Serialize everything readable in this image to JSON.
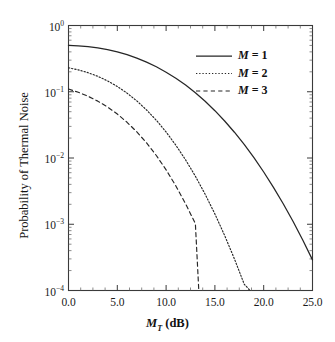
{
  "chart_data": {
    "type": "line",
    "title": "",
    "xlabel": "M_T (dB)",
    "xlabel_parts": {
      "var": "M",
      "sub": "T",
      "unit": "(dB)"
    },
    "ylabel": "Probability of Thermal Noise",
    "xlim": [
      0.0,
      25.0
    ],
    "ylim": [
      0.0001,
      1.0
    ],
    "yscale": "log",
    "xscale": "linear",
    "grid": false,
    "legend_position": "top-right",
    "xticks": [
      "0.0",
      "5.0",
      "10.0",
      "15.0",
      "20.0",
      "25.0"
    ],
    "xtick_values": [
      0.0,
      5.0,
      10.0,
      15.0,
      20.0,
      25.0
    ],
    "yticks": [
      {
        "mantissa": "10",
        "exponent": "0",
        "value": 1.0
      },
      {
        "mantissa": "10",
        "exponent": "-1",
        "value": 0.1
      },
      {
        "mantissa": "10",
        "exponent": "-2",
        "value": 0.01
      },
      {
        "mantissa": "10",
        "exponent": "-3",
        "value": 0.001
      },
      {
        "mantissa": "10",
        "exponent": "-4",
        "value": 0.0001
      }
    ],
    "series": [
      {
        "name": "M = 1",
        "legend_var": "M",
        "legend_value": "1",
        "style": "solid",
        "color": "#262626",
        "x": [
          0.0,
          1.0,
          2.0,
          3.0,
          4.0,
          5.0,
          6.0,
          7.0,
          8.0,
          9.0,
          10.0,
          11.0,
          12.0,
          13.0,
          14.0,
          15.0,
          16.0,
          17.0,
          18.0,
          19.0,
          20.0,
          21.0,
          22.0,
          23.0,
          24.0,
          25.0
        ],
        "y": [
          0.5,
          0.492,
          0.478,
          0.458,
          0.432,
          0.4,
          0.363,
          0.322,
          0.28,
          0.238,
          0.197,
          0.16,
          0.126,
          0.0965,
          0.0718,
          0.0518,
          0.0362,
          0.0245,
          0.016,
          0.0101,
          0.00615,
          0.00361,
          0.00204,
          0.00111,
          0.00058,
          0.00029
        ]
      },
      {
        "name": "M = 2",
        "legend_var": "M",
        "legend_value": "2",
        "style": "dotted",
        "color": "#262626",
        "x": [
          0.0,
          1.0,
          2.0,
          3.0,
          4.0,
          5.0,
          6.0,
          7.0,
          8.0,
          9.0,
          10.0,
          11.0,
          12.0,
          13.0,
          14.0,
          15.0,
          16.0,
          17.0,
          18.0,
          18.6
        ],
        "y": [
          0.23,
          0.214,
          0.194,
          0.171,
          0.146,
          0.12,
          0.0953,
          0.0727,
          0.0531,
          0.0371,
          0.0247,
          0.0156,
          0.00936,
          0.00531,
          0.00284,
          0.00143,
          0.000676,
          0.0003,
          0.000125,
          0.0001
        ]
      },
      {
        "name": "M = 3",
        "legend_var": "M",
        "legend_value": "3",
        "style": "dashed",
        "color": "#262626",
        "x": [
          0.0,
          1.0,
          2.0,
          3.0,
          4.0,
          5.0,
          6.0,
          7.0,
          8.0,
          9.0,
          10.0,
          11.0,
          12.0,
          13.0,
          13.35
        ],
        "y": [
          0.11,
          0.0983,
          0.0855,
          0.0722,
          0.0588,
          0.0461,
          0.0346,
          0.0248,
          0.0169,
          0.0109,
          0.00663,
          0.00379,
          0.00203,
          0.00102,
          0.0001
        ]
      }
    ]
  },
  "legend": {
    "entries": [
      {
        "label_var": "M",
        "label_eq": " = 1",
        "style": "solid"
      },
      {
        "label_var": "M",
        "label_eq": " = 2",
        "style": "dotted"
      },
      {
        "label_var": "M",
        "label_eq": " = 3",
        "style": "dashed"
      }
    ]
  }
}
